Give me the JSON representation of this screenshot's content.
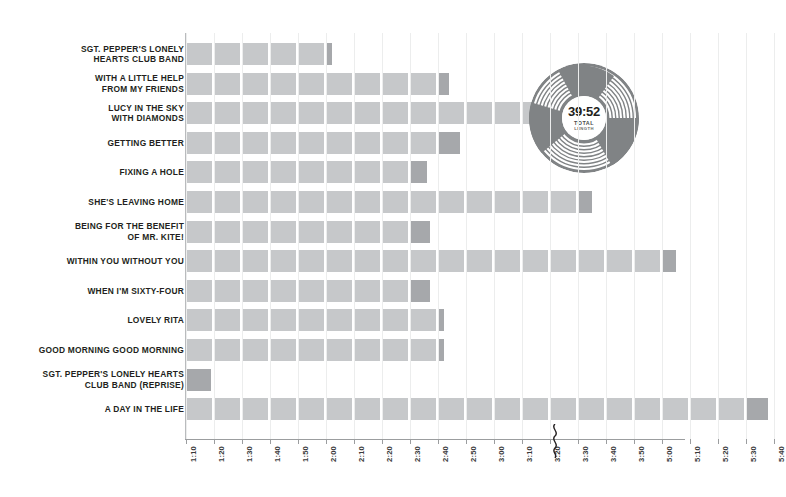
{
  "chart_data": {
    "type": "bar",
    "orientation": "horizontal",
    "title": "",
    "xlabel": "",
    "ylabel": "",
    "grid": true,
    "legend": null,
    "axis_start": "1:10",
    "axis_break_between": [
      "3:50",
      "5:00"
    ],
    "tick_labels": [
      "1:10",
      "1:20",
      "1:30",
      "1:40",
      "1:50",
      "2:00",
      "2:10",
      "2:20",
      "2:30",
      "2:40",
      "2:50",
      "3:00",
      "3:10",
      "3:20",
      "3:30",
      "3:40",
      "3:50",
      "5:00",
      "5:10",
      "5:20",
      "5:30",
      "5:40"
    ],
    "categories": [
      "SGT. PEPPER'S LONELY HEARTS CLUB BAND",
      "WITH A LITTLE HELP FROM MY FRIENDS",
      "LUCY IN THE SKY WITH DIAMONDS",
      "GETTING BETTER",
      "FIXING A HOLE",
      "SHE'S LEAVING HOME",
      "BEING FOR THE BENEFIT OF MR. KITE!",
      "WITHIN YOU WITHOUT YOU",
      "WHEN I'M SIXTY-FOUR",
      "LOVELY RITA",
      "GOOD MORNING GOOD MORNING",
      "SGT. PEPPER'S LONELY HEARTS CLUB BAND (REPRISE)",
      "A DAY IN THE LIFE"
    ],
    "values": [
      "2:02",
      "2:44",
      "3:28",
      "2:48",
      "2:36",
      "3:35",
      "2:37",
      "5:05",
      "2:37",
      "2:42",
      "2:42",
      "1:19",
      "5:38"
    ],
    "values_seconds": [
      122,
      164,
      208,
      168,
      156,
      215,
      157,
      305,
      157,
      162,
      162,
      79,
      338
    ],
    "total_length": "39:52"
  },
  "rows": [
    {
      "label_lines": [
        "SGT. PEPPER'S LONELY",
        "HEARTS CLUB BAND"
      ],
      "value": "2:02"
    },
    {
      "label_lines": [
        "WITH A LITTLE HELP",
        "FROM MY FRIENDS"
      ],
      "value": "2:44"
    },
    {
      "label_lines": [
        "LUCY IN THE SKY",
        "WITH DIAMONDS"
      ],
      "value": "3:28"
    },
    {
      "label_lines": [
        "GETTING BETTER"
      ],
      "value": "2:48"
    },
    {
      "label_lines": [
        "FIXING A HOLE"
      ],
      "value": "2:36"
    },
    {
      "label_lines": [
        "SHE'S LEAVING HOME"
      ],
      "value": "3:35"
    },
    {
      "label_lines": [
        "BEING FOR THE BENEFIT",
        "OF MR. KITE!"
      ],
      "value": "2:37"
    },
    {
      "label_lines": [
        "WITHIN YOU WITHOUT YOU"
      ],
      "value": "5:05"
    },
    {
      "label_lines": [
        "WHEN I'M SIXTY-FOUR"
      ],
      "value": "2:37"
    },
    {
      "label_lines": [
        "LOVELY RITA"
      ],
      "value": "2:42"
    },
    {
      "label_lines": [
        "GOOD MORNING GOOD MORNING"
      ],
      "value": "2:42"
    },
    {
      "label_lines": [
        "SGT. PEPPER'S LONELY HEARTS",
        "CLUB BAND (REPRISE)"
      ],
      "value": "1:19"
    },
    {
      "label_lines": [
        "A DAY IN THE LIFE"
      ],
      "value": "5:38"
    }
  ],
  "record": {
    "time": "39:52",
    "caption_line1": "TOTAL",
    "caption_line2": "LENGTH"
  },
  "colors": {
    "bar": "#c6c8ca",
    "bar_tail": "#a6a8ab",
    "record": "#808385",
    "axis": "#9b9d9f",
    "text": "#231f20",
    "background": "#ffffff"
  }
}
